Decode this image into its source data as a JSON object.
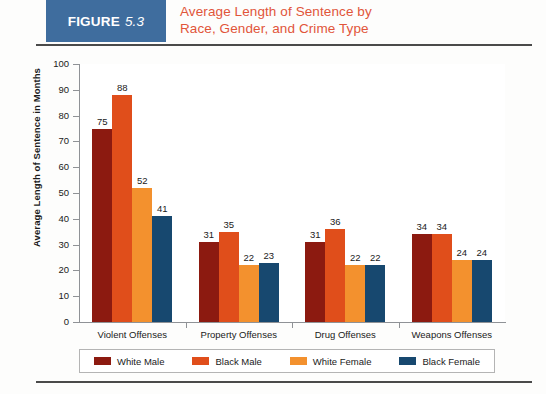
{
  "header": {
    "badge_word": "FIGURE",
    "badge_number": "5.3",
    "title_line1": "Average Length of Sentence by",
    "title_line2": "Race, Gender, and Crime Type",
    "badge_color": "#3f6d9e",
    "title_color": "#e1553a"
  },
  "chart_data": {
    "type": "bar",
    "title": "Average Length of Sentence by Race, Gender, and Crime Type",
    "xlabel": "",
    "ylabel": "Average Length of Sentence in Months",
    "ylim": [
      0,
      100
    ],
    "ytick_step": 10,
    "yticks": [
      "0",
      "10",
      "20",
      "30",
      "40",
      "50",
      "60",
      "70",
      "80",
      "90",
      "100"
    ],
    "grid": false,
    "legend_position": "bottom",
    "categories": [
      "Violent Offenses",
      "Property Offenses",
      "Drug Offenses",
      "Weapons Offenses"
    ],
    "series": [
      {
        "name": "White Male",
        "color": "#8c1a10",
        "values": [
          75,
          31,
          31,
          34
        ]
      },
      {
        "name": "Black Male",
        "color": "#e04e1b",
        "values": [
          88,
          35,
          36,
          34
        ]
      },
      {
        "name": "White Female",
        "color": "#f3912e",
        "values": [
          52,
          22,
          22,
          24
        ]
      },
      {
        "name": "Black Female",
        "color": "#17486f",
        "values": [
          41,
          23,
          22,
          24
        ]
      }
    ]
  }
}
